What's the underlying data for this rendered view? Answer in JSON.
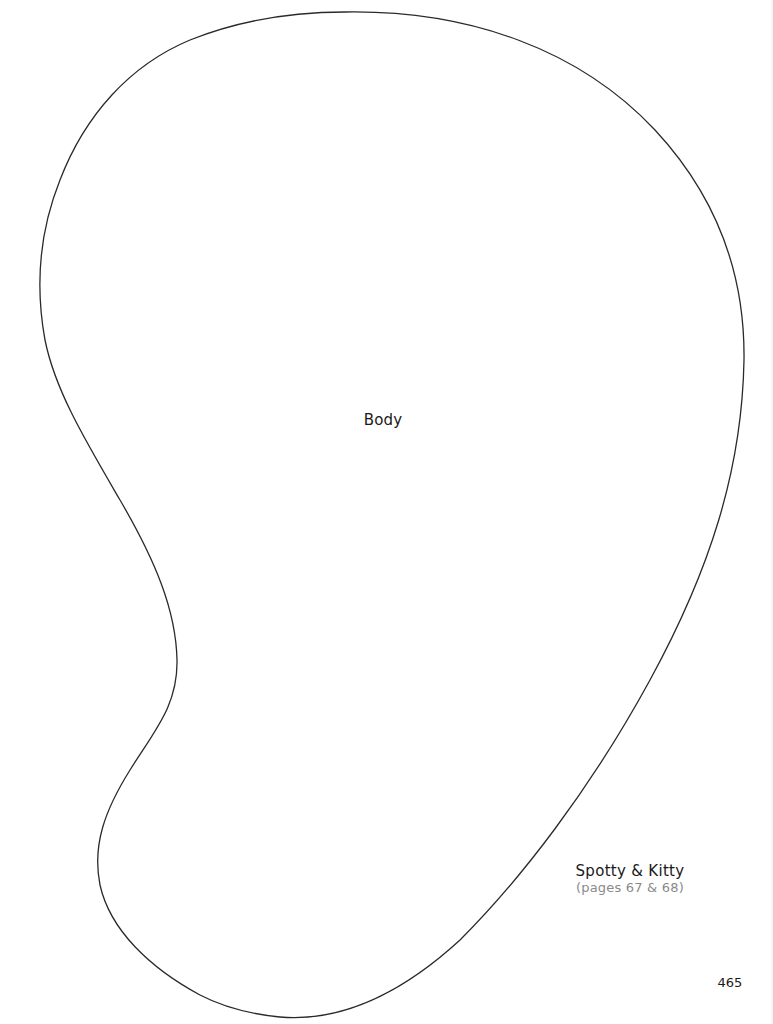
{
  "page": {
    "background": "#ffffff",
    "line_color": "#2a2a2a"
  },
  "pattern_piece": {
    "label": "Body",
    "outline_shape": "kidney/bean-shaped closed curve"
  },
  "credit": {
    "title": "Spotty & Kitty",
    "pages": "(pages 67 & 68)"
  },
  "footer": {
    "page_number": "465"
  }
}
